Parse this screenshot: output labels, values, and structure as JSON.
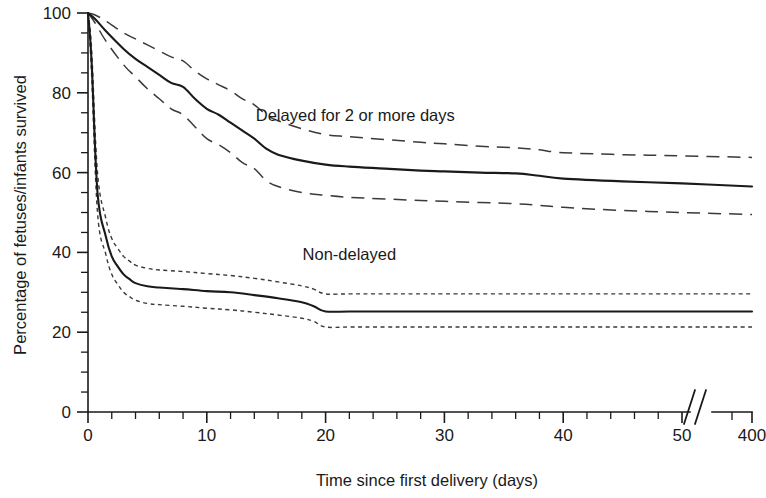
{
  "chart_data": {
    "type": "line",
    "title": "",
    "subtitle": "",
    "xlabel": "Time since first delivery (days)",
    "ylabel": "Percentage of fetuses/infants survived",
    "xlim": [
      0,
      400
    ],
    "ylim": [
      0,
      100
    ],
    "grid": false,
    "legend_position": "inline-annotations",
    "axis_break": {
      "present": true,
      "symbol": "//",
      "after_tick": 50,
      "before_tick": 400,
      "note": "x-axis compressed between 55 and 400 days"
    },
    "x_ticks_major": [
      0,
      10,
      20,
      30,
      40,
      50,
      400
    ],
    "x_tick_labels": [
      "0",
      "10",
      "20",
      "30",
      "40",
      "50",
      "400"
    ],
    "x_minor_tick_interval": 2,
    "y_ticks_major": [
      0,
      20,
      40,
      60,
      80,
      100
    ],
    "y_tick_labels": [
      "0",
      "20",
      "40",
      "60",
      "80",
      "100"
    ],
    "y_minor_tick_interval": 5,
    "annotations": [
      {
        "text": "Delayed for 2 or more days",
        "x_days": 22.5,
        "y_percent": 73,
        "for_series": "delayed"
      },
      {
        "text": "Non-delayed",
        "x_days": 22.0,
        "y_percent": 38,
        "for_series": "non-delayed"
      }
    ],
    "series": [
      {
        "name": "Delayed for 2 or more days",
        "style": "solid",
        "color": "#1a1a1a",
        "x": [
          0,
          0.6,
          1.5,
          3,
          4,
          5,
          6,
          7,
          8,
          9,
          10,
          11,
          12,
          13,
          14,
          15,
          16,
          18,
          20,
          22,
          25,
          28,
          30,
          33,
          36,
          38,
          40,
          45,
          50,
          400
        ],
        "y": [
          100,
          98.5,
          95.5,
          91,
          88.5,
          86.5,
          84.5,
          82.5,
          81.5,
          78.5,
          76,
          74.5,
          72.5,
          70.5,
          68.5,
          66,
          64.5,
          63,
          62,
          61.5,
          61,
          60.5,
          60.3,
          60,
          59.8,
          59.2,
          58.5,
          57.8,
          57.3,
          56.5
        ]
      },
      {
        "name": "Delayed upper 95% CI",
        "style": "dashed",
        "color": "#3a3a3a",
        "x": [
          0,
          0.6,
          1.5,
          3,
          4,
          5,
          6,
          7,
          8,
          9,
          10,
          11,
          12,
          13,
          14,
          15,
          16,
          18,
          20,
          22,
          25,
          28,
          30,
          33,
          36,
          38,
          40,
          45,
          50,
          400
        ],
        "y": [
          100,
          99.5,
          98,
          95,
          93.5,
          92,
          90.5,
          89,
          88,
          85.5,
          83.5,
          82,
          80.5,
          78.5,
          77,
          74.5,
          73,
          71,
          69.5,
          69,
          68.3,
          67.6,
          67.2,
          66.6,
          66.2,
          65.7,
          65,
          64.5,
          64.2,
          63.8
        ]
      },
      {
        "name": "Delayed lower 95% CI",
        "style": "dashed",
        "color": "#3a3a3a",
        "x": [
          0,
          0.6,
          1.5,
          3,
          4,
          5,
          6,
          7,
          8,
          9,
          10,
          11,
          12,
          13,
          14,
          15,
          16,
          18,
          20,
          22,
          25,
          28,
          30,
          33,
          36,
          38,
          40,
          45,
          50,
          400
        ],
        "y": [
          100,
          97.5,
          93,
          87,
          84,
          81,
          78.5,
          76,
          74.5,
          71.5,
          68.5,
          67,
          65,
          62.5,
          61,
          58,
          56.5,
          55,
          54.3,
          53.8,
          53.4,
          53,
          52.8,
          52.5,
          52.2,
          51.8,
          51.3,
          50.5,
          50,
          49.5
        ]
      },
      {
        "name": "Non-delayed",
        "style": "solid",
        "color": "#1a1a1a",
        "x": [
          0,
          0.3,
          0.8,
          1.5,
          2,
          2.5,
          3,
          3.5,
          4,
          5,
          6,
          8,
          10,
          12,
          14,
          16,
          18,
          19,
          20,
          22,
          25,
          30,
          40,
          50,
          400
        ],
        "y": [
          100,
          88,
          55,
          44,
          39,
          36.5,
          34.5,
          33.3,
          32.3,
          31.5,
          31.2,
          30.8,
          30.3,
          30,
          29.3,
          28.5,
          27.5,
          26.5,
          25.2,
          25.2,
          25.2,
          25.2,
          25.2,
          25.2,
          25.2
        ]
      },
      {
        "name": "Non-delayed upper 95% CI",
        "style": "dotted",
        "color": "#3a3a3a",
        "x": [
          0,
          0.3,
          0.8,
          1.5,
          2,
          2.5,
          3,
          3.5,
          4,
          5,
          6,
          8,
          10,
          12,
          14,
          16,
          18,
          19,
          20,
          22,
          25,
          30,
          40,
          50,
          400
        ],
        "y": [
          100,
          91,
          60,
          48.5,
          43.5,
          41,
          39,
          37.8,
          36.8,
          36,
          35.6,
          35.2,
          34.7,
          34.2,
          33.5,
          32.6,
          31.6,
          30.8,
          29.6,
          29.6,
          29.6,
          29.6,
          29.6,
          29.6,
          29.6
        ]
      },
      {
        "name": "Non-delayed lower 95% CI",
        "style": "dotted",
        "color": "#3a3a3a",
        "x": [
          0,
          0.3,
          0.8,
          1.5,
          2,
          2.5,
          3,
          3.5,
          4,
          5,
          6,
          8,
          10,
          12,
          14,
          16,
          18,
          19,
          20,
          22,
          25,
          30,
          40,
          50,
          400
        ],
        "y": [
          100,
          85,
          50,
          39.5,
          34.5,
          32,
          30,
          28.9,
          28,
          27.2,
          26.9,
          26.5,
          26,
          25.6,
          25,
          24.3,
          23.5,
          22.7,
          21.3,
          21.3,
          21.3,
          21.3,
          21.3,
          21.3,
          21.3
        ]
      }
    ]
  },
  "figure": {
    "background_color": "#ffffff",
    "axis_color": "#1a1a1a"
  }
}
